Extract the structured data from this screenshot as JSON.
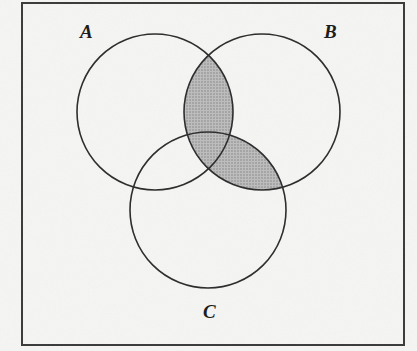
{
  "figure": {
    "kind": "venn-diagram",
    "set_count": 3,
    "labels": {
      "a": "A",
      "b": "B",
      "c": "C"
    },
    "shaded_description": "(A ∩ B) ∪ (B ∩ C)",
    "colors": {
      "background": "#f5f5f3",
      "stroke": "#2b2b2b",
      "shade": "#b2b2b2",
      "border": "#3a3a3a",
      "label": "#1d1d1d"
    },
    "frame": {
      "x": 22,
      "y": 3,
      "width": 382,
      "height": 342,
      "stroke_width": 2
    },
    "circles": [
      {
        "id": "A",
        "cx": 155,
        "cy": 112,
        "r": 78
      },
      {
        "id": "B",
        "cx": 262,
        "cy": 112,
        "r": 78
      },
      {
        "id": "C",
        "cx": 208,
        "cy": 210,
        "r": 78
      }
    ],
    "label_positions": {
      "a": {
        "x": 80,
        "y": 22
      },
      "b": {
        "x": 324,
        "y": 22
      },
      "c": {
        "x": 203,
        "y": 302
      }
    }
  }
}
